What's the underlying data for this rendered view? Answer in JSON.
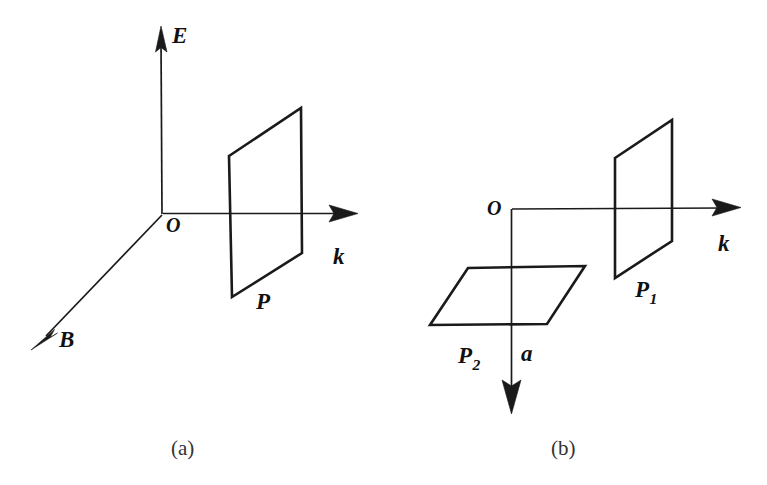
{
  "figure": {
    "background_color": "#ffffff",
    "ink_color": "#1a1a1a",
    "width": 767,
    "height": 485
  },
  "panels": [
    {
      "id": "a",
      "caption": "(a)",
      "origin_label": "O",
      "axes": [
        {
          "name": "E",
          "label": "E",
          "direction": "up",
          "from": [
            163,
            214
          ],
          "to": [
            161,
            28
          ]
        },
        {
          "name": "B",
          "label": "B",
          "direction": "down-left",
          "from": [
            163,
            214
          ],
          "to": [
            32,
            348
          ]
        },
        {
          "name": "k",
          "label": "k",
          "direction": "right",
          "from": [
            163,
            214
          ],
          "to": [
            357,
            213
          ]
        }
      ],
      "planes": [
        {
          "name": "P",
          "label": "P",
          "points": [
            [
              229,
              156
            ],
            [
              301,
              108
            ],
            [
              302,
              253
            ],
            [
              232,
              297
            ]
          ]
        }
      ]
    },
    {
      "id": "b",
      "caption": "(b)",
      "origin_label": "O",
      "axes": [
        {
          "name": "k",
          "label": "k",
          "direction": "right",
          "from": [
            512,
            211
          ],
          "to": [
            740,
            207
          ]
        },
        {
          "name": "a",
          "label": "a",
          "direction": "down",
          "from": [
            512,
            211
          ],
          "to": [
            511,
            412
          ]
        }
      ],
      "planes": [
        {
          "name": "P1",
          "label": "P",
          "subscript": "1",
          "points": [
            [
              615,
              158
            ],
            [
              672,
              120
            ],
            [
              672,
              241
            ],
            [
              615,
              278
            ]
          ]
        },
        {
          "name": "P2",
          "label": "P",
          "subscript": "2",
          "points": [
            [
              468,
              268
            ],
            [
              585,
              266
            ],
            [
              547,
              324
            ],
            [
              430,
              325
            ]
          ]
        }
      ]
    }
  ]
}
